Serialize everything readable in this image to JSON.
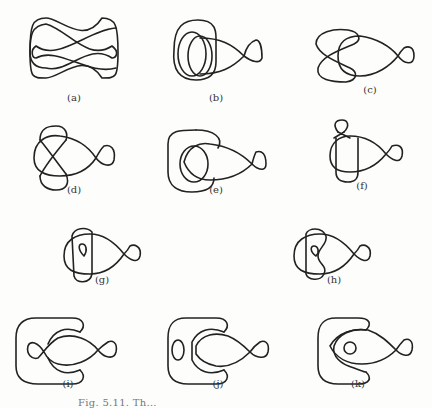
{
  "figure": {
    "panels": [
      {
        "id": "a",
        "label": "(a)"
      },
      {
        "id": "b",
        "label": "(b)"
      },
      {
        "id": "c",
        "label": "(c)"
      },
      {
        "id": "d",
        "label": "(d)"
      },
      {
        "id": "e",
        "label": "(e)"
      },
      {
        "id": "f",
        "label": "(f)"
      },
      {
        "id": "g",
        "label": "(g)"
      },
      {
        "id": "h",
        "label": "(h)"
      },
      {
        "id": "i",
        "label": "(i)"
      },
      {
        "id": "j",
        "label": "(j)"
      },
      {
        "id": "k",
        "label": "(k)"
      }
    ],
    "caption": "Fig. 5.11. Th…",
    "stroke_color": "#222222",
    "background_color": "#fdfdfb"
  }
}
